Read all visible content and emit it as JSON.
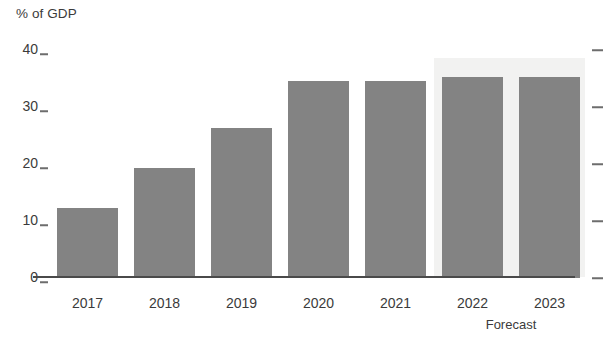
{
  "chart_data": {
    "type": "bar",
    "title": "",
    "ylabel": "% of GDP",
    "xlabel": "",
    "categories": [
      "2017",
      "2018",
      "2019",
      "2020",
      "2021",
      "2022",
      "2023"
    ],
    "values": [
      12.3,
      19.3,
      26.4,
      34.5,
      34.5,
      35.3,
      35.3
    ],
    "ylim": [
      0,
      40
    ],
    "yticks": [
      0,
      10,
      20,
      30,
      40
    ],
    "ytick_labels": [
      "0",
      "10",
      "20",
      "30",
      "40"
    ],
    "grid": false,
    "legend": null,
    "annotations": [
      {
        "text": "Forecast",
        "applies_to": [
          "2022",
          "2023"
        ],
        "kind": "shaded-band-caption"
      }
    ],
    "series": [
      {
        "name": "% of GDP",
        "color": "#838383",
        "values": [
          12.3,
          19.3,
          26.4,
          34.5,
          34.5,
          35.3,
          35.3
        ]
      }
    ],
    "colors": {
      "bar": "#838383",
      "forecast_band": "#f2f2f1",
      "axis": "#4a4a4a",
      "tick": "#6d6d6d",
      "text": "#3b3b3b",
      "background": "#ffffff"
    }
  },
  "axis": {
    "y_title": "% of GDP"
  },
  "forecast": {
    "label": "Forecast"
  }
}
